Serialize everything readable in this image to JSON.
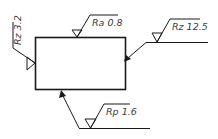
{
  "diagram": {
    "type": "surface-roughness-drawing",
    "line_color": "#1a1a1a",
    "text_color": "#3a3a3a",
    "symbols": [
      {
        "id": "left",
        "label": "Rz 3.2",
        "orientation": "vertical"
      },
      {
        "id": "top",
        "label": "Ra 0.8",
        "orientation": "horizontal"
      },
      {
        "id": "right",
        "label": "Rz 12.5",
        "orientation": "horizontal"
      },
      {
        "id": "bottom",
        "label": "Rp 1.6",
        "orientation": "horizontal"
      }
    ]
  }
}
